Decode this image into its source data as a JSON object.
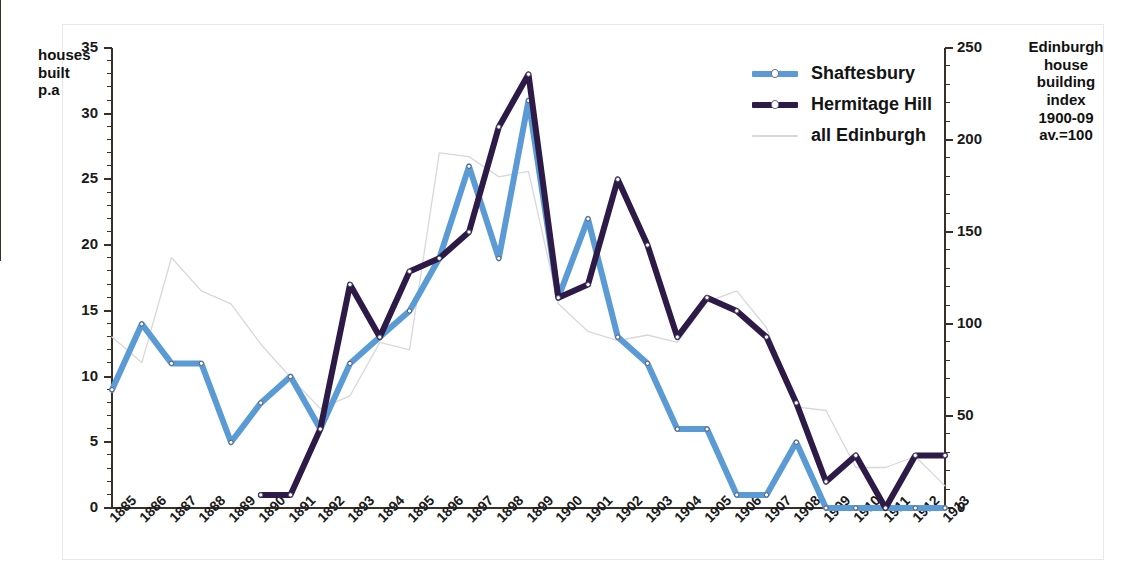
{
  "chart_data": {
    "type": "line",
    "title": "",
    "xlabel": "",
    "ylabel": "houses built p.a",
    "y2label": "Edinburgh house building index 1900-09 av.=100",
    "ylim": [
      0,
      35
    ],
    "y2lim": [
      0,
      250
    ],
    "yticks": [
      0,
      5,
      10,
      15,
      20,
      25,
      30,
      35
    ],
    "y2ticks": [
      0,
      50,
      100,
      150,
      200,
      250
    ],
    "grid": false,
    "legend_position": "top-right",
    "categories": [
      "1885",
      "1886",
      "1887",
      "1888",
      "1889",
      "1890",
      "1891",
      "1892",
      "1893",
      "1894",
      "1895",
      "1896",
      "1897",
      "1898",
      "1899",
      "1900",
      "1901",
      "1902",
      "1903",
      "1904",
      "1905",
      "1906",
      "1907",
      "1908",
      "1909",
      "1910",
      "1911",
      "1912",
      "1913"
    ],
    "series": [
      {
        "name": "Shaftesbury",
        "color": "#5B9BD5",
        "axis": "left",
        "values": [
          9,
          14,
          11,
          11,
          5,
          8,
          10,
          6,
          11,
          13,
          15,
          19,
          26,
          19,
          31,
          16,
          22,
          13,
          11,
          6,
          6,
          1,
          1,
          5,
          0,
          0,
          0,
          0,
          0
        ]
      },
      {
        "name": "Hermitage Hill",
        "color": "#2E1A47",
        "axis": "left",
        "values": [
          null,
          null,
          null,
          null,
          null,
          1,
          1,
          6,
          17,
          13,
          18,
          19,
          21,
          29,
          33,
          16,
          17,
          25,
          20,
          13,
          16,
          15,
          13,
          8,
          2,
          4,
          0,
          4,
          4
        ]
      },
      {
        "name": "all Edinburgh",
        "color": "#D8D8DC",
        "axis": "right",
        "values": [
          93,
          79,
          136,
          118,
          111,
          89,
          71,
          54,
          61,
          90,
          86,
          193,
          191,
          180,
          183,
          111,
          96,
          91,
          94,
          90,
          112,
          118,
          98,
          55,
          53,
          22,
          22,
          28,
          12
        ]
      }
    ]
  },
  "legend": {
    "items": [
      {
        "label": "Shaftesbury"
      },
      {
        "label": "Hermitage Hill"
      },
      {
        "label": "all Edinburgh"
      }
    ]
  },
  "axis_titles": {
    "left": "houses built p.a",
    "right": "Edinburgh house building index 1900-09 av.=100"
  }
}
